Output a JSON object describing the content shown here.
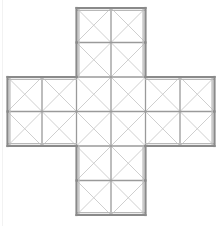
{
  "figure": {
    "description": "Plus-shaped polyomino made of five square blocks, each subdivided into a 2 by 2 grid of cells, with both diagonals drawn inside every cell",
    "shape_name": "greek-cross",
    "background_color": "#ffffff",
    "outline_color": "#8a8a8a",
    "outline_highlight_color": "#b8b8b8",
    "grid_line_color": "#9a9a9a",
    "diagonal_line_color": "#c9c9c9",
    "outline_width": 2.2,
    "grid_line_width": 1.3,
    "diagonal_line_width": 0.9,
    "canvas_width": 218,
    "canvas_height": 226,
    "block_columns": 3,
    "block_rows": 3,
    "cells_per_block_side": 2,
    "total_blocks": 5,
    "total_cells": 20,
    "total_diagonals": 40,
    "cell_size_x": 34.5,
    "cell_size_y": 34.5,
    "origin_x": 7.5,
    "origin_y": 8.0,
    "arm_blocks": [
      {
        "name": "top-arm",
        "col": 1,
        "row": 0
      },
      {
        "name": "left-arm",
        "col": 0,
        "row": 1
      },
      {
        "name": "center-block",
        "col": 1,
        "row": 1
      },
      {
        "name": "right-arm",
        "col": 2,
        "row": 1
      },
      {
        "name": "bottom-arm",
        "col": 1,
        "row": 2
      }
    ]
  }
}
